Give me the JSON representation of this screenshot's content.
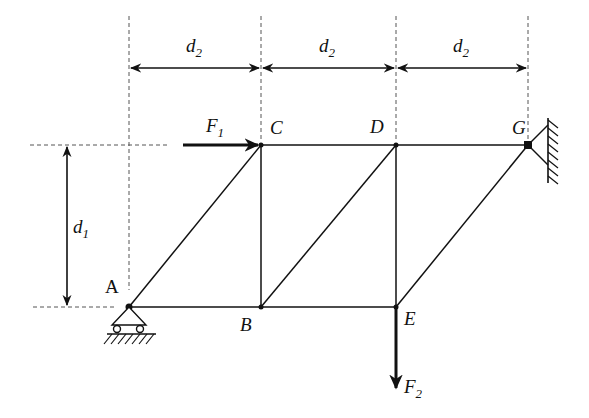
{
  "diagram": {
    "type": "truss",
    "colors": {
      "line": "#111111",
      "dash": "#555555",
      "background": "#ffffff"
    },
    "nodes": [
      {
        "id": "A",
        "label": "A",
        "x": 129,
        "y": 307
      },
      {
        "id": "B",
        "label": "B",
        "x": 261,
        "y": 307
      },
      {
        "id": "C",
        "label": "C",
        "x": 261,
        "y": 145
      },
      {
        "id": "D",
        "label": "D",
        "x": 396,
        "y": 145
      },
      {
        "id": "E",
        "label": "E",
        "x": 396,
        "y": 307
      },
      {
        "id": "G",
        "label": "G",
        "x": 528,
        "y": 145
      }
    ],
    "members": [
      [
        "A",
        "B"
      ],
      [
        "B",
        "E"
      ],
      [
        "C",
        "D"
      ],
      [
        "D",
        "G"
      ],
      [
        "A",
        "C"
      ],
      [
        "B",
        "C"
      ],
      [
        "B",
        "D"
      ],
      [
        "D",
        "E"
      ],
      [
        "E",
        "G"
      ]
    ],
    "supports": [
      {
        "node": "A",
        "type": "roller"
      },
      {
        "node": "G",
        "type": "pin-wall"
      }
    ],
    "loads": [
      {
        "label": "F",
        "subscript": "1",
        "node": "C",
        "direction": "right"
      },
      {
        "label": "F",
        "subscript": "2",
        "node": "E",
        "direction": "down"
      }
    ],
    "dimensions": [
      {
        "label": "d",
        "subscript": "2",
        "from": "A",
        "to": "B",
        "axis": "horizontal"
      },
      {
        "label": "d",
        "subscript": "2",
        "from": "B",
        "to": "E",
        "axis": "horizontal"
      },
      {
        "label": "d",
        "subscript": "2",
        "from": "E",
        "to": "G",
        "axis": "horizontal"
      },
      {
        "label": "d",
        "subscript": "1",
        "from": "C",
        "to": "B",
        "axis": "vertical"
      }
    ]
  },
  "labels": {
    "A": "A",
    "B": "B",
    "C": "C",
    "D": "D",
    "E": "E",
    "G": "G",
    "F1": "F",
    "F1_sub": "1",
    "F2": "F",
    "F2_sub": "2",
    "d2_1": "d",
    "d2_1_sub": "2",
    "d2_2": "d",
    "d2_2_sub": "2",
    "d2_3": "d",
    "d2_3_sub": "2",
    "d1": "d",
    "d1_sub": "1"
  }
}
